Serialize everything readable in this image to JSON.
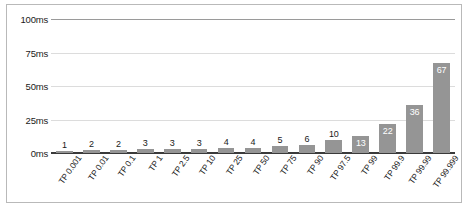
{
  "chart_data": {
    "type": "bar",
    "title": "",
    "xlabel": "",
    "ylabel": "",
    "ylim": [
      0,
      100
    ],
    "grid": true,
    "legend": "none",
    "unit": "ms",
    "categories": [
      "TP 0.001",
      "TP 0.01",
      "TP 0.1",
      "TP 1",
      "TP 2.5",
      "TP 10",
      "TP 25",
      "TP 50",
      "TP 75",
      "TP 90",
      "TP 97.5",
      "TP 99",
      "TP 99.9",
      "TP 99.99",
      "TP 99.999"
    ],
    "values": [
      1,
      2,
      2,
      3,
      3,
      3,
      4,
      4,
      5,
      6,
      10,
      13,
      22,
      36,
      67
    ],
    "yticks": [
      {
        "value": 0,
        "label": "0ms"
      },
      {
        "value": 25,
        "label": "25ms"
      },
      {
        "value": 50,
        "label": "50ms"
      },
      {
        "value": 75,
        "label": "75ms"
      },
      {
        "value": 100,
        "label": "100ms"
      }
    ],
    "colors": {
      "bar": "#959595",
      "grid": "#dcdcdc",
      "axis": "#3a3a3a",
      "label": "#1a1a1a",
      "label_inside": "#ffffff",
      "frame": "#b9b9b9",
      "background": "#ffffff"
    },
    "value_label_inside_threshold": 13
  }
}
